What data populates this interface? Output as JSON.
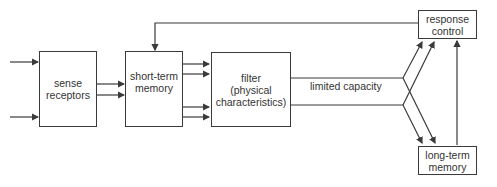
{
  "diagram": {
    "type": "flow",
    "nodes": [
      {
        "id": "sense",
        "label_line1": "sense",
        "label_line2": "receptors"
      },
      {
        "id": "stm",
        "label_line1": "short-term",
        "label_line2": "memory"
      },
      {
        "id": "filter",
        "label_line1": "filter",
        "label_line2": "(physical",
        "label_line3": "characteristics)"
      },
      {
        "id": "response",
        "label_line1": "response",
        "label_line2": "control"
      },
      {
        "id": "ltm",
        "label_line1": "long-term",
        "label_line2": "memory"
      }
    ],
    "channel_label": "limited capacity",
    "colors": {
      "line": "#3a3a3a",
      "text": "#333333",
      "background": "#ffffff"
    }
  }
}
